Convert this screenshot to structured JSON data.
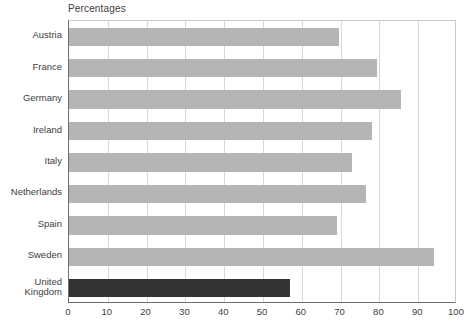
{
  "chart_data": {
    "type": "bar",
    "orientation": "horizontal",
    "title": "Percentages",
    "xlabel": "",
    "ylabel": "",
    "xlim": [
      0,
      100
    ],
    "xticks": [
      0,
      10,
      20,
      30,
      40,
      50,
      60,
      70,
      80,
      90,
      100
    ],
    "grid": true,
    "legend": false,
    "categories": [
      "Austria",
      "France",
      "Germany",
      "Ireland",
      "Italy",
      "Netherlands",
      "Spain",
      "Sweden",
      "United\nKingdom"
    ],
    "values": [
      69.5,
      79.5,
      85.5,
      78,
      73,
      76.5,
      69,
      94,
      57
    ],
    "bar_colors": [
      "#b5b5b5",
      "#b5b5b5",
      "#b5b5b5",
      "#b5b5b5",
      "#b5b5b5",
      "#b5b5b5",
      "#b5b5b5",
      "#b5b5b5",
      "#333333"
    ]
  },
  "colors": {
    "bar_default": "#b5b5b5",
    "bar_highlight": "#333333",
    "gridline": "#d8d8d8",
    "axis": "#6e6e6e",
    "text": "#3d3d3d",
    "background": "#ffffff"
  }
}
